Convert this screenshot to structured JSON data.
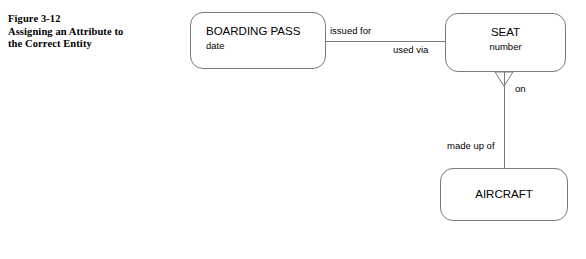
{
  "figure": {
    "caption_lines": [
      "Figure 3-12",
      "Assigning an Attribute to",
      "the Correct Entity"
    ]
  },
  "diagram": {
    "type": "entity-relationship-diagram",
    "notation": "crow's foot",
    "line_color": "#7a7a7a",
    "text_color": "#000000",
    "background": "#ffffff",
    "entities": [
      {
        "id": "boarding-pass",
        "title": "BOARDING PASS",
        "attributes": [
          "date"
        ],
        "text_align": "left"
      },
      {
        "id": "seat",
        "title": "SEAT",
        "attributes": [
          "number"
        ],
        "text_align": "center"
      },
      {
        "id": "aircraft",
        "title": "AIRCRAFT",
        "attributes": [],
        "text_align": "center"
      }
    ],
    "relationships": [
      {
        "id": "boarding-pass-seat",
        "from": "boarding-pass",
        "to": "seat",
        "from_label": "issued for",
        "to_label": "used via",
        "from_marker": "crows-foot",
        "to_marker": "none",
        "orientation": "horizontal"
      },
      {
        "id": "seat-aircraft",
        "from": "seat",
        "to": "aircraft",
        "from_label": "on",
        "to_label": "made up of",
        "from_marker": "crows-foot",
        "to_marker": "none",
        "orientation": "vertical"
      }
    ]
  }
}
